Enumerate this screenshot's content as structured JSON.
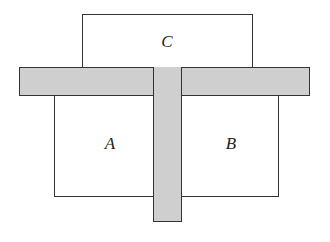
{
  "diagram": {
    "title": "",
    "regions": [
      {
        "id": "C",
        "label": "C",
        "kind": "box"
      },
      {
        "id": "A",
        "label": "A",
        "kind": "box"
      },
      {
        "id": "B",
        "label": "B",
        "kind": "box"
      }
    ],
    "barriers": [
      {
        "id": "horizontal-bar",
        "orientation": "horizontal",
        "fill": "#cfcfcf"
      },
      {
        "id": "vertical-bar",
        "orientation": "vertical",
        "fill": "#cfcfcf"
      }
    ],
    "labels": {
      "c": "C",
      "a": "A",
      "b": "B"
    }
  }
}
